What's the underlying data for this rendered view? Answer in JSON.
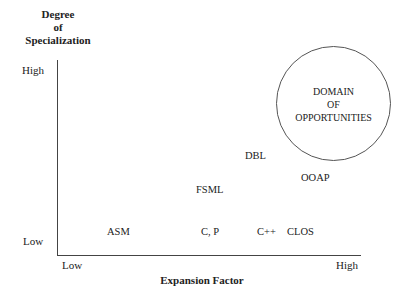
{
  "y_axis": {
    "title_lines": [
      "Degree",
      "of",
      "Specialization"
    ],
    "high_label": "High",
    "low_label": "Low"
  },
  "x_axis": {
    "title": "Expansion Factor",
    "low_label": "Low",
    "high_label": "High"
  },
  "domain_circle": {
    "lines": [
      "DOMAIN",
      "OF",
      "OPPORTUNITIES"
    ]
  },
  "points": [
    {
      "label": "ASM"
    },
    {
      "label": "C, P"
    },
    {
      "label": "C++"
    },
    {
      "label": "CLOS"
    },
    {
      "label": "FSML"
    },
    {
      "label": "DBL"
    },
    {
      "label": "OOAP"
    }
  ]
}
